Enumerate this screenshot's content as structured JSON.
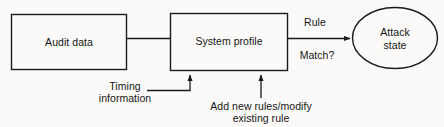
{
  "diagram": {
    "type": "flow-diagram",
    "background_color": "#fbfaf8",
    "stroke_color": "#1a1a1a",
    "text_color": "#151515",
    "nodes": [
      {
        "id": "audit-data",
        "shape": "rectangle",
        "label": "Audit data",
        "x": 11,
        "y": 14,
        "width": 116,
        "height": 56
      },
      {
        "id": "system-profile",
        "shape": "rectangle",
        "label": "System profile",
        "x": 170,
        "y": 13,
        "width": 118,
        "height": 58
      },
      {
        "id": "attack-state",
        "shape": "ellipse",
        "label_line1": "Attack",
        "label_line2": "state",
        "cx": 395,
        "cy": 38,
        "rx": 43,
        "ry": 31
      }
    ],
    "edges": [
      {
        "id": "audit-to-profile",
        "from": "audit-data",
        "to": "system-profile",
        "arrowhead": false,
        "label": ""
      },
      {
        "id": "profile-to-attack",
        "from": "system-profile",
        "to": "attack-state",
        "arrowhead": true,
        "label_above": "Rule",
        "label_below": "Match?"
      },
      {
        "id": "timing-to-profile",
        "from": "timing-information",
        "to": "system-profile",
        "arrowhead": true,
        "label": ""
      },
      {
        "id": "rules-to-profile",
        "from": "add-new-rules",
        "to": "system-profile",
        "arrowhead": true,
        "label": ""
      }
    ],
    "annotations": [
      {
        "id": "timing-information",
        "line1": "Timing",
        "line2": "information",
        "x": 125,
        "y": 90
      },
      {
        "id": "add-new-rules",
        "line1": "Add new rules/modify",
        "line2": "existing rule",
        "x": 261,
        "y": 110
      }
    ]
  }
}
